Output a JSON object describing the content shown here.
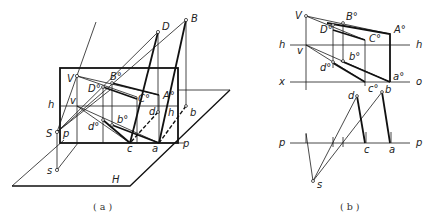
{
  "figure_a": {
    "caption": "( a )",
    "labels": {
      "D": "D",
      "B": "B",
      "V": "V",
      "B0": "B°",
      "D0": "D°",
      "C0": "C°",
      "A0": "A°",
      "h_left": "h",
      "v": "v",
      "d": "d",
      "h_right": "h",
      "b": "b",
      "S": "S",
      "p_left": "p",
      "d0": "d°",
      "b0": "b°",
      "c": "c",
      "a": "a",
      "p_right": "p",
      "s": "s",
      "H": "H"
    }
  },
  "figure_b": {
    "caption": "( b )",
    "labels": {
      "V": "V",
      "B0": "B°",
      "D0": "D°",
      "C0": "C°",
      "A0": "A°",
      "h_left": "h",
      "v": "v",
      "b0": "b°",
      "h_right": "h",
      "d0": "d°",
      "x": "x",
      "a0": "a°",
      "o": "o",
      "c0": "c°",
      "d": "d",
      "b": "b",
      "p_left": "p",
      "c": "c",
      "a": "a",
      "p_right": "p",
      "s": "s"
    }
  }
}
